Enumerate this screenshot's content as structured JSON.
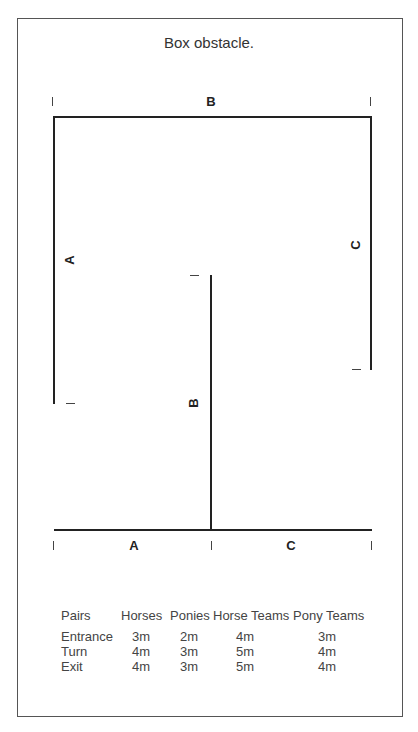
{
  "title": "Box obstacle.",
  "diagram": {
    "top_label": "B",
    "left_label": "A",
    "middle_label": "B",
    "right_label": "C",
    "bottom_left_label": "A",
    "bottom_right_label": "C"
  },
  "table": {
    "headers": [
      "Pairs",
      "Horses",
      "Ponies",
      "Horse Teams",
      "Pony Teams"
    ],
    "rows": [
      [
        "Entrance",
        "3m",
        "2m",
        "4m",
        "3m"
      ],
      [
        "Turn",
        "4m",
        "3m",
        "5m",
        "4m"
      ],
      [
        "Exit",
        "4m",
        "3m",
        "5m",
        "4m"
      ]
    ]
  }
}
